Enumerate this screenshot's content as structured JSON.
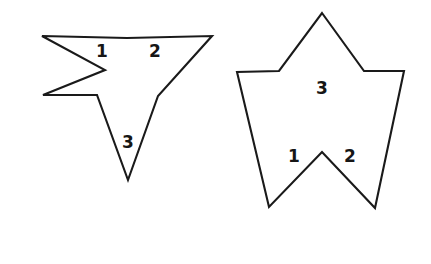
{
  "figure": {
    "title": "",
    "background_color": "#ffffff",
    "stroke_color": "#1a1a1a",
    "label_color": "#161616",
    "canvas": {
      "width": 431,
      "height": 264
    },
    "shapes": [
      {
        "id": "left-arrow-star",
        "name": "downward-four-point-star",
        "kind": "polygon",
        "points": "42,36 127,38 212,36 158,96 128,180 97,95 43,95 105,70",
        "region_labels": [
          {
            "text": "1",
            "x": 102,
            "y": 52
          },
          {
            "text": "2",
            "x": 155,
            "y": 52
          },
          {
            "text": "3",
            "x": 128,
            "y": 143
          }
        ],
        "internal_lines": []
      },
      {
        "id": "right-pentagram",
        "name": "five-point-star-pentagram",
        "kind": "polygon",
        "points": "322,13 364,71 404,71 375,208 322,152 269,207 237,72 279,71",
        "region_labels": [
          {
            "text": "1",
            "x": 294,
            "y": 157
          },
          {
            "text": "2",
            "x": 350,
            "y": 157
          },
          {
            "text": "3",
            "x": 322,
            "y": 89
          }
        ],
        "internal_lines": []
      }
    ]
  }
}
